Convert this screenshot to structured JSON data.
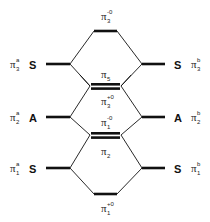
{
  "diagram": {
    "type": "orbital-correlation-diagram",
    "colors": {
      "line": "#111111",
      "text": "#222222",
      "background": "#ffffff"
    },
    "left_levels": [
      {
        "id": "pi3a",
        "base": "π",
        "sub": "3",
        "sup": "a",
        "symmetry": "S",
        "y": 64
      },
      {
        "id": "pi2a",
        "base": "π",
        "sub": "2",
        "sup": "a",
        "symmetry": "A",
        "y": 117
      },
      {
        "id": "pi1a",
        "base": "π",
        "sub": "1",
        "sup": "a",
        "symmetry": "S",
        "y": 168
      }
    ],
    "right_levels": [
      {
        "id": "pi3b",
        "base": "π",
        "sub": "3",
        "sup": "b",
        "symmetry": "S",
        "y": 64
      },
      {
        "id": "pi2b",
        "base": "π",
        "sub": "2",
        "sup": "b",
        "symmetry": "A",
        "y": 117
      },
      {
        "id": "pi1b",
        "base": "π",
        "sub": "1",
        "sup": "b",
        "symmetry": "S",
        "y": 168
      }
    ],
    "center_levels": [
      {
        "id": "pi3-0",
        "base": "π",
        "sub": "3",
        "sup": "-0",
        "y": 31,
        "double": false,
        "label_pos": "above"
      },
      {
        "id": "pi5",
        "base": "π",
        "sub": "5",
        "sup": "",
        "y": 86,
        "double": true,
        "label_pos": "above"
      },
      {
        "id": "pi3+0",
        "base": "π",
        "sub": "3",
        "sup": "+0",
        "y": 86,
        "double": true,
        "label_pos": "below"
      },
      {
        "id": "pi1-0",
        "base": "π",
        "sub": "1",
        "sup": "-0",
        "y": 135,
        "double": true,
        "label_pos": "above"
      },
      {
        "id": "pi2",
        "base": "π",
        "sub": "2",
        "sup": "",
        "y": 135,
        "double": true,
        "label_pos": "below"
      },
      {
        "id": "pi1+0",
        "base": "π",
        "sub": "1",
        "sup": "+0",
        "y": 194,
        "double": false,
        "label_pos": "below"
      }
    ],
    "labels": {
      "top": {
        "base": "π",
        "sub": "3",
        "sup": "-0"
      },
      "pi5": {
        "base": "π",
        "sub": "5"
      },
      "pi3p0": {
        "base": "π",
        "sub": "3",
        "sup": "+0"
      },
      "pi1m0": {
        "base": "π",
        "sub": "1",
        "sup": "-0"
      },
      "pi2": {
        "base": "π",
        "sub": "2"
      },
      "bottom": {
        "base": "π",
        "sub": "1",
        "sup": "+0"
      },
      "left": [
        {
          "base": "π",
          "sub": "3",
          "sup": "a",
          "sym": "S"
        },
        {
          "base": "π",
          "sub": "2",
          "sup": "a",
          "sym": "A"
        },
        {
          "base": "π",
          "sub": "1",
          "sup": "a",
          "sym": "S"
        }
      ],
      "right": [
        {
          "base": "π",
          "sub": "3",
          "sup": "b",
          "sym": "S"
        },
        {
          "base": "π",
          "sub": "2",
          "sup": "b",
          "sym": "A"
        },
        {
          "base": "π",
          "sub": "1",
          "sup": "b",
          "sym": "S"
        }
      ]
    }
  }
}
